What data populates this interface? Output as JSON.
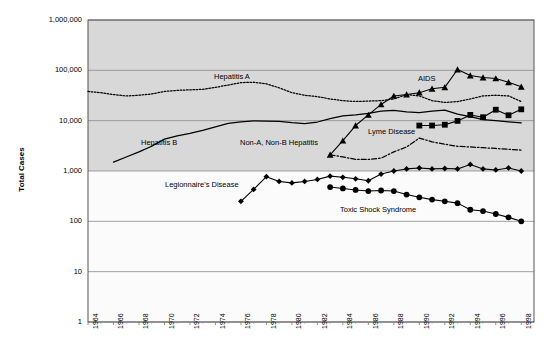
{
  "chart_data": {
    "type": "line",
    "title": "",
    "xlabel": "",
    "ylabel": "Total Cases",
    "yscale": "log",
    "ylim": [
      1,
      1000000
    ],
    "xlim": [
      1964,
      1999
    ],
    "grid": true,
    "legend_position": "inline-labels",
    "ytick_labels": [
      "1,000,000",
      "100,000",
      "10,000",
      "1,000",
      "100",
      "10",
      "1"
    ],
    "ytick_values": [
      1000000,
      100000,
      10000,
      1000,
      100,
      10,
      1
    ],
    "xtick_labels": [
      "1964",
      "1966",
      "1968",
      "1970",
      "1972",
      "1974",
      "1976",
      "1978",
      "1980",
      "1982",
      "1984",
      "1986",
      "1988",
      "1990",
      "1992",
      "1994",
      "1996",
      "1998"
    ],
    "xtick_values": [
      1964,
      1966,
      1968,
      1970,
      1972,
      1974,
      1976,
      1978,
      1980,
      1982,
      1984,
      1986,
      1988,
      1990,
      1992,
      1994,
      1996,
      1998
    ],
    "shaded_bands": [
      {
        "from": 1000,
        "to": 1000000,
        "color": "#d8d8d8"
      },
      {
        "from": 1,
        "to": 1000,
        "color": "#fbfbfb"
      }
    ],
    "series": [
      {
        "name": "Hepatitis A",
        "style": "dotted",
        "marker": "none",
        "color": "#000000",
        "x": [
          1964,
          1965,
          1966,
          1967,
          1968,
          1969,
          1970,
          1971,
          1972,
          1973,
          1974,
          1975,
          1976,
          1977,
          1978,
          1979,
          1980,
          1981,
          1982,
          1983,
          1984,
          1985,
          1986,
          1987,
          1988,
          1989,
          1990,
          1991,
          1992,
          1993,
          1994,
          1995,
          1996,
          1997,
          1998
        ],
        "values": [
          38000,
          36000,
          33000,
          31000,
          32000,
          34000,
          38000,
          40000,
          41000,
          42000,
          46000,
          51000,
          57000,
          58000,
          54000,
          45000,
          36000,
          32000,
          30000,
          27000,
          25000,
          24000,
          24500,
          25000,
          27000,
          33000,
          31000,
          25000,
          23000,
          24000,
          27000,
          31000,
          32000,
          31000,
          24000
        ]
      },
      {
        "name": "Hepatitis B",
        "style": "solid",
        "marker": "none",
        "color": "#000000",
        "x": [
          1966,
          1967,
          1968,
          1969,
          1970,
          1971,
          1972,
          1973,
          1974,
          1975,
          1976,
          1977,
          1978,
          1979,
          1980,
          1981,
          1982,
          1983,
          1984,
          1985,
          1986,
          1987,
          1988,
          1989,
          1990,
          1991,
          1992,
          1993,
          1994,
          1995,
          1996,
          1997,
          1998
        ],
        "values": [
          1500,
          1900,
          2400,
          3100,
          4300,
          5000,
          5600,
          6400,
          7500,
          8800,
          9500,
          9900,
          9800,
          9700,
          9100,
          8700,
          9400,
          11000,
          12500,
          13000,
          14000,
          15500,
          16000,
          15000,
          14500,
          15500,
          16200,
          13500,
          12000,
          10500,
          10000,
          9500,
          9000
        ]
      },
      {
        "name": "Non-A, Non-B Hepatitis",
        "style": "dashdot",
        "marker": "none",
        "color": "#000000",
        "x": [
          1983,
          1984,
          1985,
          1986,
          1987,
          1988,
          1989,
          1990,
          1991,
          1992,
          1993,
          1994,
          1995,
          1996,
          1997,
          1998
        ],
        "values": [
          2100,
          1900,
          1700,
          1700,
          1800,
          2400,
          3000,
          4500,
          3800,
          3400,
          3100,
          3000,
          2900,
          2800,
          2700,
          2600
        ]
      },
      {
        "name": "AIDS",
        "style": "solid",
        "marker": "triangle",
        "color": "#000000",
        "x": [
          1983,
          1984,
          1985,
          1986,
          1987,
          1988,
          1989,
          1990,
          1991,
          1992,
          1993,
          1994,
          1995,
          1996,
          1997,
          1998
        ],
        "values": [
          2100,
          4000,
          8000,
          13000,
          21000,
          31000,
          33000,
          36000,
          43000,
          46000,
          104000,
          79000,
          72000,
          69000,
          58000,
          47000
        ]
      },
      {
        "name": "Lyme Disease",
        "style": "solid",
        "marker": "square",
        "color": "#000000",
        "x": [
          1990,
          1991,
          1992,
          1993,
          1994,
          1995,
          1996,
          1997,
          1998
        ],
        "values": [
          8000,
          8000,
          8300,
          9900,
          13000,
          11700,
          16500,
          12800,
          16800
        ]
      },
      {
        "name": "Legionnaire's Disease",
        "style": "solid",
        "marker": "diamond",
        "color": "#000000",
        "x": [
          1976,
          1977,
          1978,
          1979,
          1980,
          1981,
          1982,
          1983,
          1984,
          1985,
          1986,
          1987,
          1988,
          1989,
          1990,
          1991,
          1992,
          1993,
          1994,
          1995,
          1996,
          1997,
          1998
        ],
        "values": [
          250,
          430,
          770,
          620,
          580,
          620,
          680,
          790,
          750,
          700,
          640,
          870,
          1000,
          1100,
          1150,
          1100,
          1120,
          1100,
          1350,
          1100,
          1050,
          1150,
          1000
        ]
      },
      {
        "name": "Toxic Shock Syndrome",
        "style": "solid",
        "marker": "circle",
        "color": "#000000",
        "x": [
          1983,
          1984,
          1985,
          1986,
          1987,
          1988,
          1989,
          1990,
          1991,
          1992,
          1993,
          1994,
          1995,
          1996,
          1997,
          1998
        ],
        "values": [
          480,
          450,
          420,
          400,
          410,
          400,
          340,
          300,
          270,
          250,
          230,
          170,
          160,
          140,
          120,
          100
        ]
      }
    ],
    "annotations": [
      {
        "text": "Hepatitis A",
        "x_px": 214,
        "y_px": 72
      },
      {
        "text": "Hepatitis B",
        "x_px": 141,
        "y_px": 138
      },
      {
        "text": "Non-A, Non-B Hepatitis",
        "x_px": 240,
        "y_px": 138
      },
      {
        "text": "AIDS",
        "x_px": 418,
        "y_px": 74
      },
      {
        "text": "Lyme Disease",
        "x_px": 368,
        "y_px": 127
      },
      {
        "text": "Legionnaire's Disease",
        "x_px": 165,
        "y_px": 180
      },
      {
        "text": "Toxic Shock Syndrome",
        "x_px": 340,
        "y_px": 205
      }
    ]
  }
}
